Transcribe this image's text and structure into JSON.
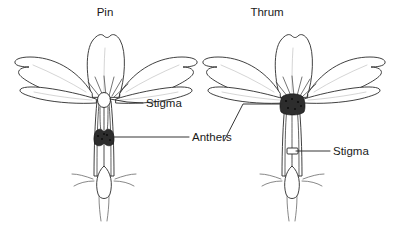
{
  "figure": {
    "kind": "botanical-diagram",
    "background_color": "#ffffff",
    "ink_color": "#2b2b2b",
    "anther_color": "#2d2d2d"
  },
  "flowers": [
    {
      "id": "pin",
      "title": "Pin",
      "title_x": 105,
      "title_y": 16,
      "labels": [
        {
          "key": "stigma",
          "text": "Stigma",
          "x": 146,
          "y": 107
        },
        {
          "key": "anthers",
          "text": "Anthers",
          "x": 192,
          "y": 140
        }
      ]
    },
    {
      "id": "thrum",
      "title": "Thrum",
      "title_x": 267,
      "title_y": 16,
      "labels": [
        {
          "key": "stigma",
          "text": "Stigma",
          "x": 333,
          "y": 156
        }
      ]
    }
  ],
  "shared_labels": [
    {
      "key": "anthers",
      "text": "Anthers",
      "x": 192,
      "y": 140
    }
  ],
  "label_texts": {
    "pin_title": "Pin",
    "thrum_title": "Thrum",
    "stigma": "Stigma",
    "anthers": "Anthers"
  }
}
